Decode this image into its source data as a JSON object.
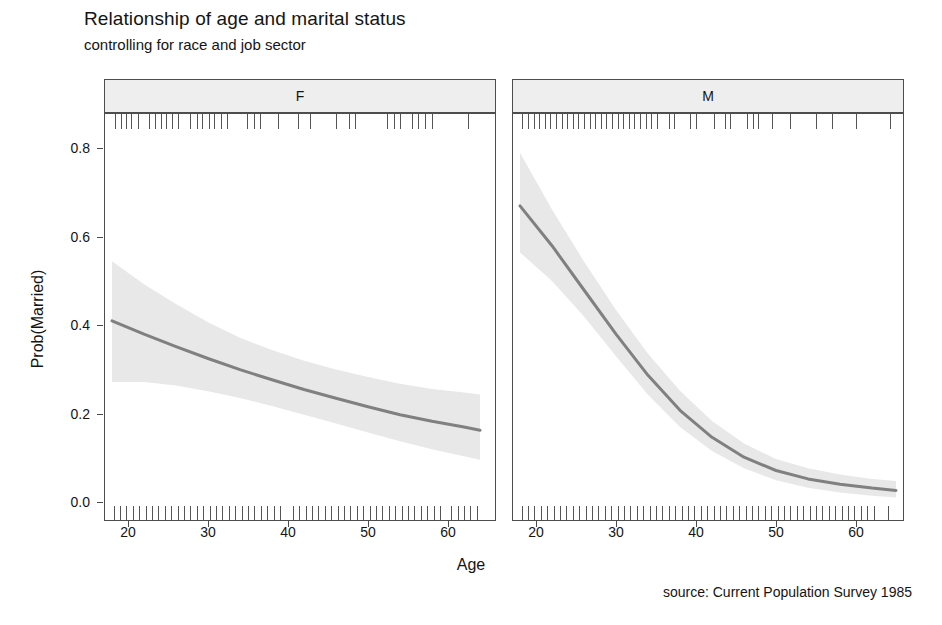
{
  "title": "Relationship of age and marital status",
  "subtitle": "controlling for race and job sector",
  "caption": "source: Current Population Survey 1985",
  "axes": {
    "xlabel": "Age",
    "ylabel": "Prob(Married)",
    "ytick_labels": [
      "0.8",
      "0.6",
      "0.4",
      "0.2",
      "0.0"
    ],
    "xtick_labels": [
      "20",
      "30",
      "40",
      "50",
      "60"
    ]
  },
  "panels": [
    {
      "label": "F",
      "name": "panel-f"
    },
    {
      "label": "M",
      "name": "panel-m"
    }
  ],
  "colors": {
    "line": "#808080",
    "band": "#e8e8e8",
    "frame": "#4d4d4d",
    "strip_fill": "#eeeeee",
    "rug": "#555555",
    "text": "#141414"
  },
  "chart_data": {
    "type": "line",
    "title": "Relationship of age and marital status",
    "subtitle": "controlling for race and job sector",
    "xlabel": "Age",
    "ylabel": "Prob(Married)",
    "xlim": [
      17.0,
      66.0
    ],
    "ylim": [
      -0.04,
      0.88
    ],
    "xticks": [
      20,
      30,
      40,
      50,
      60
    ],
    "yticks": [
      0.0,
      0.2,
      0.4,
      0.6,
      0.8
    ],
    "grid": false,
    "legend": "none",
    "facets": [
      "F",
      "M"
    ],
    "annotation": "source: Current Population Survey 1985",
    "series": [
      {
        "name": "F",
        "facet": "F",
        "x": [
          18,
          22,
          26,
          30,
          34,
          38,
          42,
          46,
          50,
          54,
          58,
          62,
          64
        ],
        "values": [
          0.41,
          0.38,
          0.352,
          0.325,
          0.3,
          0.277,
          0.255,
          0.235,
          0.216,
          0.198,
          0.183,
          0.17,
          0.163
        ],
        "ci_lower": [
          0.272,
          0.272,
          0.264,
          0.251,
          0.236,
          0.218,
          0.198,
          0.178,
          0.158,
          0.138,
          0.12,
          0.104,
          0.096
        ],
        "ci_upper": [
          0.545,
          0.493,
          0.448,
          0.407,
          0.372,
          0.344,
          0.32,
          0.3,
          0.283,
          0.268,
          0.256,
          0.248,
          0.244
        ]
      },
      {
        "name": "M",
        "facet": "M",
        "x": [
          18,
          22,
          26,
          30,
          34,
          38,
          42,
          46,
          50,
          54,
          58,
          62,
          65
        ],
        "values": [
          0.67,
          0.58,
          0.48,
          0.38,
          0.287,
          0.208,
          0.147,
          0.102,
          0.072,
          0.053,
          0.041,
          0.032,
          0.027
        ],
        "ci_lower": [
          0.565,
          0.5,
          0.42,
          0.33,
          0.243,
          0.17,
          0.116,
          0.077,
          0.05,
          0.033,
          0.022,
          0.015,
          0.011
        ],
        "ci_upper": [
          0.79,
          0.662,
          0.544,
          0.435,
          0.336,
          0.252,
          0.184,
          0.133,
          0.098,
          0.077,
          0.063,
          0.053,
          0.048
        ]
      }
    ],
    "rug_f_top": [
      18.4,
      19.1,
      19.7,
      20.4,
      21.2,
      22.6,
      23.4,
      24.1,
      24.8,
      25.5,
      26.3,
      27.8,
      28.6,
      29.3,
      30.1,
      30.8,
      31.6,
      32.4,
      34.9,
      35.7,
      36.5,
      38.8,
      41.2,
      42.8,
      46.0,
      47.6,
      48.4,
      52.4,
      53.2,
      54.0,
      55.5,
      56.3,
      57.1,
      58.0,
      62.5
    ],
    "rug_f_bottom": [
      18.2,
      19.0,
      19.8,
      20.6,
      21.4,
      22.2,
      23.0,
      23.8,
      24.6,
      25.4,
      26.2,
      27.0,
      27.8,
      28.6,
      29.4,
      30.2,
      31.0,
      31.8,
      32.6,
      33.4,
      34.2,
      35.0,
      35.8,
      36.6,
      37.4,
      38.2,
      39.0,
      40.6,
      41.4,
      42.2,
      43.0,
      43.8,
      44.6,
      45.4,
      46.2,
      47.0,
      47.8,
      48.6,
      49.4,
      50.2,
      51.0,
      51.8,
      52.6,
      53.4,
      54.2,
      55.0,
      55.8,
      56.6,
      57.4,
      58.2,
      59.0,
      60.4,
      61.2,
      62.0,
      62.8,
      63.6
    ],
    "rug_m_top": [
      18.3,
      19.0,
      19.7,
      20.4,
      21.1,
      21.8,
      22.5,
      23.2,
      23.9,
      24.6,
      25.3,
      26.0,
      26.7,
      27.4,
      28.1,
      28.8,
      29.5,
      30.2,
      30.9,
      31.6,
      32.3,
      33.0,
      33.7,
      34.4,
      35.1,
      36.6,
      37.3,
      39.3,
      40.0,
      42.2,
      43.6,
      44.3,
      46.4,
      47.1,
      47.8,
      49.5,
      51.8,
      55.0,
      57.0,
      60.0,
      64.2
    ],
    "rug_m_bottom": [
      18.2,
      19.0,
      19.8,
      20.6,
      21.4,
      22.2,
      23.0,
      23.8,
      24.6,
      25.4,
      26.2,
      27.0,
      27.8,
      28.6,
      29.4,
      30.2,
      31.0,
      31.8,
      32.6,
      33.4,
      34.2,
      35.0,
      35.8,
      36.6,
      37.4,
      38.2,
      39.0,
      39.8,
      40.6,
      41.4,
      42.2,
      43.0,
      43.8,
      44.6,
      45.4,
      46.2,
      47.0,
      47.8,
      48.6,
      49.4,
      50.2,
      51.0,
      51.8,
      52.6,
      53.4,
      54.2,
      55.0,
      55.8,
      56.6,
      57.4,
      58.2,
      59.0,
      59.8,
      60.6,
      61.4,
      62.2,
      64.0
    ]
  }
}
